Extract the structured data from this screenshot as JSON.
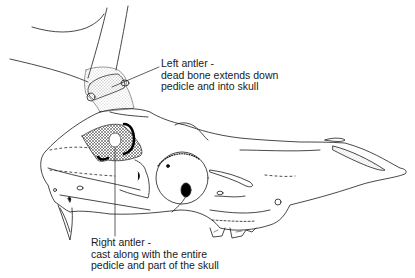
{
  "figure": {
    "line_color": "#1a1a1a",
    "stipple_color": "#9a9a9a",
    "background": "#ffffff"
  },
  "annotations": {
    "left_antler": {
      "line1": "Left antler -",
      "line2": "dead bone extends down",
      "line3": "pedicle and into skull"
    },
    "right_antler": {
      "line1": "Right antler -",
      "line2": "cast along with the entire",
      "line3": "pedicle and part of the skull"
    }
  }
}
